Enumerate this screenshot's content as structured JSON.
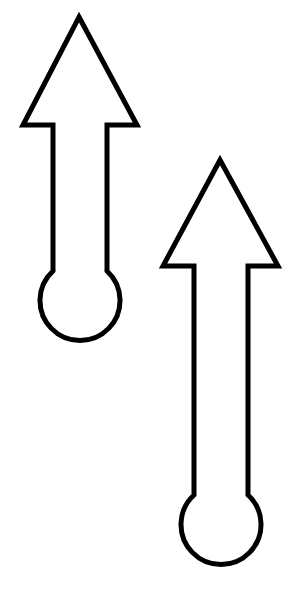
{
  "canvas": {
    "width": 306,
    "height": 593,
    "background": "#ffffff"
  },
  "stroke_color": "#000000",
  "fill_color": "#ffffff",
  "shapes": [
    {
      "name": "arrow-1",
      "direction": "up",
      "tip": [
        79,
        17
      ],
      "head_base_y": 125,
      "head_left_x": 23,
      "head_right_x": 137,
      "shaft_left_x": 53,
      "shaft_right_x": 107,
      "bulb_center": [
        82,
        302
      ],
      "bulb_radius": 40
    },
    {
      "name": "arrow-2",
      "direction": "up",
      "tip": [
        220,
        160
      ],
      "head_base_y": 266,
      "head_left_x": 163,
      "head_right_x": 278,
      "shaft_left_x": 194,
      "shaft_right_x": 248,
      "bulb_center": [
        222,
        527
      ],
      "bulb_radius": 40
    }
  ]
}
